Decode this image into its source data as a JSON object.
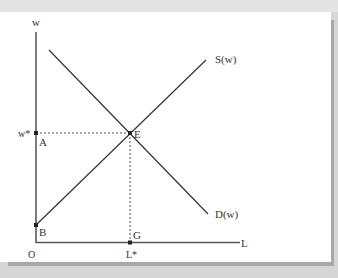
{
  "diagram": {
    "axes": {
      "y_label": "w",
      "x_label": "L",
      "origin_label": "O"
    },
    "curves": {
      "supply_label": "S(w)",
      "demand_label": "D(w)"
    },
    "points": {
      "equilibrium": "E",
      "a": "A",
      "b": "B",
      "g": "G"
    },
    "equilibrium_values": {
      "wage_label": "w*",
      "labor_label": "L*"
    },
    "colors": {
      "line": "#333333",
      "background": "#ffffff",
      "frame_shadow": "#a8a8a8"
    }
  }
}
